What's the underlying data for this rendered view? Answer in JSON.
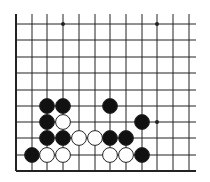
{
  "board": {
    "grid": {
      "x": [
        16,
        32,
        47,
        63,
        79,
        95,
        110,
        126,
        142,
        157,
        173,
        189
      ],
      "y": [
        24,
        40,
        57,
        73,
        90,
        106,
        122,
        138,
        155
      ],
      "top": 14,
      "bottom": 171,
      "left": 16,
      "right": 196,
      "line_color": "#222222"
    },
    "star_points": [
      [
        3,
        0
      ],
      [
        9,
        0
      ],
      [
        9,
        6
      ]
    ],
    "stones": [
      {
        "color": "black",
        "col": 2,
        "row": 5
      },
      {
        "color": "black",
        "col": 3,
        "row": 5
      },
      {
        "color": "black",
        "col": 6,
        "row": 5
      },
      {
        "color": "black",
        "col": 2,
        "row": 6
      },
      {
        "color": "white",
        "col": 3,
        "row": 6
      },
      {
        "color": "black",
        "col": 8,
        "row": 6
      },
      {
        "color": "black",
        "col": 2,
        "row": 7
      },
      {
        "color": "black",
        "col": 3,
        "row": 7
      },
      {
        "color": "white",
        "col": 4,
        "row": 7
      },
      {
        "color": "white",
        "col": 5,
        "row": 7
      },
      {
        "color": "black",
        "col": 6,
        "row": 7
      },
      {
        "color": "black",
        "col": 7,
        "row": 7
      },
      {
        "color": "black",
        "col": 1,
        "row": 8
      },
      {
        "color": "white",
        "col": 2,
        "row": 8
      },
      {
        "color": "white",
        "col": 3,
        "row": 8
      },
      {
        "color": "white",
        "col": 6,
        "row": 8
      },
      {
        "color": "white",
        "col": 7,
        "row": 8
      },
      {
        "color": "black",
        "col": 8,
        "row": 8
      }
    ],
    "colors": {
      "black": "#111111",
      "white": "#ffffff",
      "stone_outline": "#222222"
    }
  }
}
